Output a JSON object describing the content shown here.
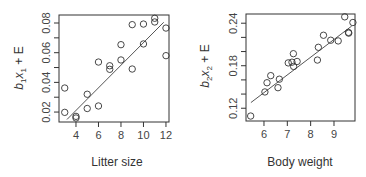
{
  "chart_data": [
    {
      "type": "scatter",
      "title": "",
      "xlabel": "Litter size",
      "ylabel": {
        "coef": "b",
        "coef_sub": "1",
        "var": "x",
        "var_sub": "1",
        "tail": " + E"
      },
      "xlim": [
        2.49,
        12.27
      ],
      "ylim": [
        0.0133,
        0.0854
      ],
      "xticks": [
        4,
        6,
        8,
        10,
        12
      ],
      "xtick_labels": [
        "4",
        "6",
        "8",
        "10",
        "12"
      ],
      "yticks": [
        0.02,
        0.03,
        0.04,
        0.05,
        0.06,
        0.07,
        0.08
      ],
      "ytick_labels": [
        "0.02",
        "",
        "0.04",
        "",
        "0.06",
        "",
        "0.08"
      ],
      "grid": false,
      "points": [
        {
          "x": 3,
          "y": 0.0362
        },
        {
          "x": 3,
          "y": 0.0198
        },
        {
          "x": 4,
          "y": 0.0171
        },
        {
          "x": 4,
          "y": 0.016
        },
        {
          "x": 5,
          "y": 0.032
        },
        {
          "x": 5,
          "y": 0.0224
        },
        {
          "x": 6,
          "y": 0.0537
        },
        {
          "x": 6,
          "y": 0.0241
        },
        {
          "x": 7,
          "y": 0.0512
        },
        {
          "x": 7,
          "y": 0.0488
        },
        {
          "x": 8,
          "y": 0.0654
        },
        {
          "x": 8,
          "y": 0.0551
        },
        {
          "x": 9,
          "y": 0.0789
        },
        {
          "x": 9,
          "y": 0.049
        },
        {
          "x": 10,
          "y": 0.0793
        },
        {
          "x": 10,
          "y": 0.0659
        },
        {
          "x": 11,
          "y": 0.0832
        },
        {
          "x": 11,
          "y": 0.0807
        },
        {
          "x": 12,
          "y": 0.0766
        },
        {
          "x": 12,
          "y": 0.058
        }
      ],
      "fit_line": [
        {
          "x": 3.2,
          "y": 0.015
        },
        {
          "x": 11.8,
          "y": 0.0805
        }
      ]
    },
    {
      "type": "scatter",
      "title": "",
      "xlabel": "Body weight",
      "ylabel": {
        "coef": "b",
        "coef_sub": "2",
        "var": "x",
        "var_sub": "2",
        "tail": " + E"
      },
      "xlim": [
        5.23,
        9.9
      ],
      "ylim": [
        0.102,
        0.253
      ],
      "xticks": [
        6,
        7,
        8,
        9
      ],
      "xtick_labels": [
        "6",
        "7",
        "8",
        "9"
      ],
      "yticks": [
        0.12,
        0.14,
        0.16,
        0.18,
        0.2,
        0.22,
        0.24
      ],
      "ytick_labels": [
        "0.12",
        "",
        "",
        "0.18",
        "",
        "",
        "0.24"
      ],
      "grid": false,
      "points": [
        {
          "x": 5.43,
          "y": 0.109
        },
        {
          "x": 6.04,
          "y": 0.143
        },
        {
          "x": 6.13,
          "y": 0.156
        },
        {
          "x": 6.29,
          "y": 0.166
        },
        {
          "x": 6.6,
          "y": 0.149
        },
        {
          "x": 6.66,
          "y": 0.161
        },
        {
          "x": 7.04,
          "y": 0.184
        },
        {
          "x": 7.2,
          "y": 0.185
        },
        {
          "x": 7.26,
          "y": 0.197
        },
        {
          "x": 7.27,
          "y": 0.179
        },
        {
          "x": 7.42,
          "y": 0.186
        },
        {
          "x": 8.29,
          "y": 0.188
        },
        {
          "x": 8.33,
          "y": 0.206
        },
        {
          "x": 8.55,
          "y": 0.223
        },
        {
          "x": 8.86,
          "y": 0.216
        },
        {
          "x": 9.18,
          "y": 0.215
        },
        {
          "x": 9.46,
          "y": 0.249
        },
        {
          "x": 9.62,
          "y": 0.227
        },
        {
          "x": 9.63,
          "y": 0.226
        },
        {
          "x": 9.81,
          "y": 0.241
        }
      ],
      "fit_line": [
        {
          "x": 5.44,
          "y": 0.128
        },
        {
          "x": 9.76,
          "y": 0.236
        }
      ]
    }
  ]
}
